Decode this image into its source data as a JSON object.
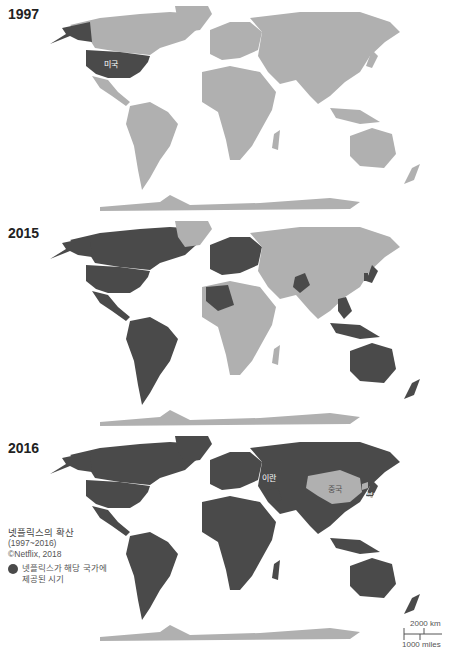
{
  "colors": {
    "available": "#4a4a4a",
    "unavailable": "#b0b0b0",
    "background": "#ffffff"
  },
  "maps": [
    {
      "year": "1997",
      "labels": [
        {
          "text": "미국",
          "country": "USA"
        }
      ]
    },
    {
      "year": "2015",
      "labels": []
    },
    {
      "year": "2016",
      "labels": [
        {
          "text": "중국",
          "country": "China"
        },
        {
          "text": "북한",
          "country": "North Korea"
        },
        {
          "text": "이란",
          "country": "Iran"
        }
      ]
    }
  ],
  "legend": {
    "title": "넷플릭스의 확산",
    "range": "(1997~2016)",
    "source": "©Netflix, 2018",
    "item_line1": "넷플릭스가 해당 국가에",
    "item_line2": "제공된 시기"
  },
  "scale": {
    "km": "2000 km",
    "miles": "1000 miles"
  }
}
